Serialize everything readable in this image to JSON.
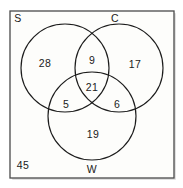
{
  "diagram": {
    "type": "venn-3-set",
    "frame": {
      "border_color": "#4a4a4a",
      "background_color": "#fdfdfb"
    },
    "stroke_color": "#1c1c1c",
    "text_color": "#1a1a1a",
    "sets": [
      {
        "id": "S",
        "label": "S",
        "label_x": 18,
        "label_y": 19
      },
      {
        "id": "C",
        "label": "C",
        "label_y": 19,
        "label_x": 115
      },
      {
        "id": "W",
        "label": "W",
        "label_x": 92,
        "label_y": 170
      }
    ],
    "circles": [
      {
        "id": "S",
        "cx": 65,
        "cy": 68,
        "r": 44
      },
      {
        "id": "C",
        "cx": 119,
        "cy": 68,
        "r": 44
      },
      {
        "id": "W",
        "cx": 92,
        "cy": 116,
        "r": 44
      }
    ],
    "regions": [
      {
        "id": "S-only",
        "label": "S only",
        "value": "28",
        "x": 45,
        "y": 64
      },
      {
        "id": "C-only",
        "label": "C only",
        "value": "17",
        "x": 135,
        "y": 65
      },
      {
        "id": "SC-only",
        "label": "S and C only",
        "value": "9",
        "x": 92,
        "y": 61
      },
      {
        "id": "SCW-all",
        "label": "S, C and W",
        "value": "21",
        "x": 92,
        "y": 88
      },
      {
        "id": "SW-only",
        "label": "S and W only",
        "value": "5",
        "x": 66,
        "y": 105
      },
      {
        "id": "CW-only",
        "label": "C and W only",
        "value": "6",
        "x": 117,
        "y": 105
      },
      {
        "id": "W-only",
        "label": "W only",
        "value": "19",
        "x": 93,
        "y": 135
      },
      {
        "id": "outside",
        "label": "Outside all sets",
        "value": "45",
        "x": 23,
        "y": 166
      }
    ]
  }
}
